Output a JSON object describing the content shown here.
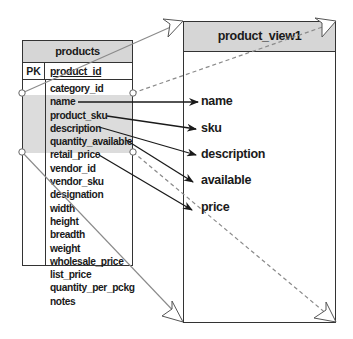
{
  "diagram": {
    "type": "table-to-view mapping",
    "colors": {
      "header_fill": "#d6d6d6",
      "highlight_fill": "#dcdcdc",
      "line": "#1a1a1a",
      "guide_line": "#888888"
    }
  },
  "products_table": {
    "title": "products",
    "pk_label": "PK",
    "pk_field": "product_id",
    "fields": [
      "category_id",
      "name",
      "product_sku",
      "description",
      "quantity_available",
      "retail_price",
      "vendor_id",
      "vendor_sku",
      "designation",
      "width",
      "height",
      "breadth",
      "weight",
      "wholesale_price",
      "list_price",
      "quantity_per_pckg",
      "notes"
    ],
    "highlighted_fields": [
      "name",
      "product_sku",
      "description",
      "quantity_available",
      "retail_price"
    ]
  },
  "view": {
    "title": "product_view1",
    "columns": [
      "name",
      "sku",
      "description",
      "available",
      "price"
    ]
  },
  "mappings": [
    {
      "from": "name",
      "to": "name"
    },
    {
      "from": "product_sku",
      "to": "sku"
    },
    {
      "from": "description",
      "to": "description"
    },
    {
      "from": "quantity_available",
      "to": "available"
    },
    {
      "from": "retail_price",
      "to": "price"
    }
  ]
}
